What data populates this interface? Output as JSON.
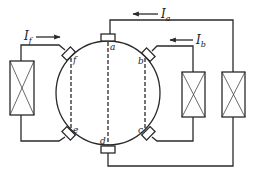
{
  "diagram": {
    "type": "dc-machine-brush-circuit",
    "colors": {
      "line": "#2a2a2a",
      "background": "#ffffff"
    },
    "brushes": [
      {
        "id": "a",
        "label": "a"
      },
      {
        "id": "b",
        "label": "b"
      },
      {
        "id": "c",
        "label": "c"
      },
      {
        "id": "d",
        "label": "d"
      },
      {
        "id": "e",
        "label": "e"
      },
      {
        "id": "f",
        "label": "f"
      }
    ],
    "currents": [
      {
        "id": "If",
        "symbol": "I",
        "subscript": "f",
        "direction": "right"
      },
      {
        "id": "Ia",
        "symbol": "I",
        "subscript": "a",
        "direction": "left"
      },
      {
        "id": "Ib",
        "symbol": "I",
        "subscript": "b",
        "direction": "left"
      }
    ],
    "windings": [
      {
        "id": "field-f",
        "connects": [
          "f",
          "e"
        ]
      },
      {
        "id": "winding-b",
        "connects": [
          "b",
          "c"
        ]
      },
      {
        "id": "winding-a",
        "connects": [
          "a",
          "d"
        ]
      }
    ],
    "dashed_axes": [
      "f-e",
      "a-d",
      "b-c"
    ]
  }
}
